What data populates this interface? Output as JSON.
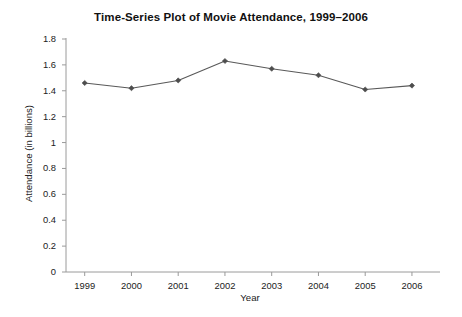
{
  "chart_data": {
    "type": "line",
    "title": "Time-Series Plot of Movie Attendance, 1999–2006",
    "xlabel": "Year",
    "ylabel": "Attendance (in billions)",
    "categories": [
      "1999",
      "2000",
      "2001",
      "2002",
      "2003",
      "2004",
      "2005",
      "2006"
    ],
    "x": [
      1999,
      2000,
      2001,
      2002,
      2003,
      2004,
      2005,
      2006
    ],
    "values": [
      1.46,
      1.42,
      1.48,
      1.63,
      1.57,
      1.52,
      1.41,
      1.44
    ],
    "series": [
      {
        "name": "Movie Attendance",
        "values": [
          1.46,
          1.42,
          1.48,
          1.63,
          1.57,
          1.52,
          1.41,
          1.44
        ]
      }
    ],
    "ylim": [
      0,
      1.8
    ],
    "yticks": [
      0,
      0.2,
      0.4,
      0.6,
      0.8,
      1.0,
      1.2,
      1.4,
      1.6,
      1.8
    ],
    "ytick_labels": [
      "0",
      "0.2",
      "0.4",
      "0.6",
      "0.8",
      "1",
      "1.2",
      "1.4",
      "1.6",
      "1.8"
    ],
    "xlim": [
      1998.6,
      2006.6
    ],
    "grid": false,
    "legend": false,
    "marker": "diamond",
    "line_color": "#595959",
    "marker_color": "#4d4d4d",
    "axis_color": "#9a9a9a",
    "background_color": "#ffffff"
  }
}
